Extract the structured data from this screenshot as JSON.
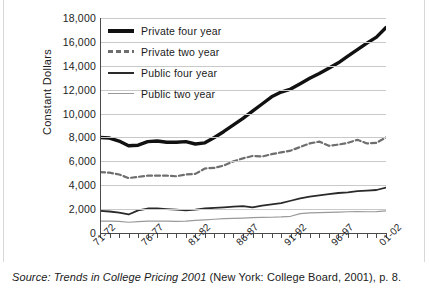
{
  "caption": {
    "prefix": "Source:",
    "title": "Trends in College Pricing 2001",
    "suffix": "(New York: College Board, 2001), p. 8."
  },
  "legend": {
    "position": "top-left-inside",
    "items": [
      {
        "label": "Private four year",
        "style": "thick-solid-black",
        "color": "#111111"
      },
      {
        "label": "Private two year",
        "style": "dashed-gray",
        "color": "#6e6e6e"
      },
      {
        "label": "Public four year",
        "style": "medium-solid-black",
        "color": "#2a2a2a"
      },
      {
        "label": "Public two year",
        "style": "thin-solid-gray",
        "color": "#9a9a9a"
      }
    ]
  },
  "chart_data": {
    "type": "line",
    "title": "",
    "subtitle": "",
    "xlabel": "",
    "ylabel": "Constant Dollars",
    "ylim": [
      0,
      18000
    ],
    "ytick_labels": [
      "18,000",
      "16,000",
      "14,000",
      "12,000",
      "10,000",
      "8,000",
      "6,000",
      "4,000",
      "2,000",
      "0"
    ],
    "ytick_values": [
      18000,
      16000,
      14000,
      12000,
      10000,
      8000,
      6000,
      4000,
      2000,
      0
    ],
    "grid": true,
    "grid_axis": "y",
    "x": [
      "71-72",
      "72-73",
      "73-74",
      "74-75",
      "75-76",
      "76-77",
      "77-78",
      "78-79",
      "79-80",
      "80-81",
      "81-82",
      "82-83",
      "83-84",
      "84-85",
      "85-86",
      "86-87",
      "87-88",
      "88-89",
      "89-90",
      "90-91",
      "91-92",
      "92-93",
      "93-94",
      "94-95",
      "95-96",
      "96-97",
      "97-98",
      "98-99",
      "99-00",
      "00-01",
      "01-02"
    ],
    "xtick_labels": [
      "71-72",
      "76-77",
      "81-82",
      "86-87",
      "91-92",
      "96-97",
      "01-02"
    ],
    "xtick_label_indices": [
      0,
      5,
      10,
      15,
      20,
      25,
      30
    ],
    "n_ticks": 31,
    "series": [
      {
        "name": "Private four year",
        "color": "#111111",
        "width": 3.4,
        "dash": "none",
        "values": [
          8000,
          7950,
          7700,
          7300,
          7350,
          7650,
          7700,
          7600,
          7600,
          7650,
          7450,
          7550,
          8000,
          8500,
          9050,
          9600,
          10200,
          10800,
          11400,
          11800,
          12050,
          12500,
          12950,
          13350,
          13800,
          14250,
          14800,
          15350,
          15900,
          16400,
          17200
        ]
      },
      {
        "name": "Private two year",
        "color": "#6e6e6e",
        "width": 2.2,
        "dash": "dashed",
        "values": [
          5100,
          5050,
          4900,
          4600,
          4700,
          4800,
          4800,
          4800,
          4750,
          4900,
          4950,
          5400,
          5450,
          5650,
          6000,
          6250,
          6450,
          6400,
          6600,
          6750,
          6900,
          7200,
          7500,
          7650,
          7300,
          7400,
          7550,
          7800,
          7500,
          7550,
          8000
        ]
      },
      {
        "name": "Public four year",
        "color": "#2a2a2a",
        "width": 1.8,
        "dash": "none",
        "values": [
          1850,
          1800,
          1700,
          1550,
          1900,
          2050,
          2050,
          2000,
          1950,
          1900,
          1950,
          2050,
          2100,
          2150,
          2200,
          2250,
          2150,
          2300,
          2400,
          2500,
          2700,
          2900,
          3050,
          3150,
          3250,
          3350,
          3400,
          3500,
          3550,
          3600,
          3800
        ]
      },
      {
        "name": "Public two year",
        "color": "#9a9a9a",
        "width": 1.2,
        "dash": "none",
        "values": [
          1000,
          1000,
          980,
          900,
          950,
          1000,
          1000,
          1000,
          980,
          1000,
          1050,
          1100,
          1150,
          1200,
          1220,
          1250,
          1280,
          1300,
          1320,
          1350,
          1400,
          1620,
          1680,
          1700,
          1720,
          1750,
          1780,
          1800,
          1780,
          1790,
          1850
        ]
      }
    ]
  }
}
